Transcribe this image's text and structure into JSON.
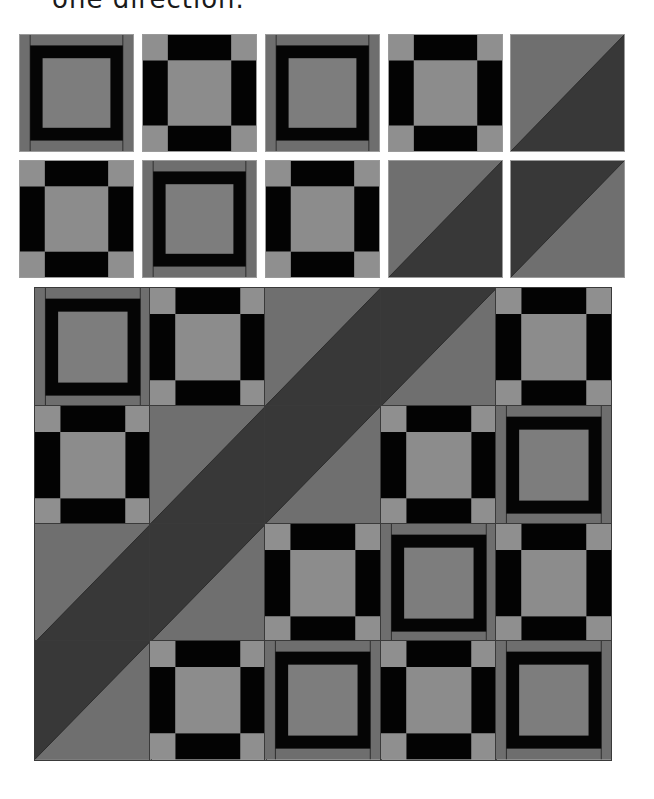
{
  "caption": {
    "text": "one direction."
  },
  "colors": {
    "background": "#ffffff",
    "frame_outer": "#6e6e6e",
    "frame_black": "#050505",
    "frame_center": "#7d7d7d",
    "nine_corner": "#8f8f8f",
    "nine_black": "#030303",
    "nine_center": "#8c8c8c",
    "hst_light": "#6f6f6f",
    "hst_dark": "#383838",
    "seam": "#2a2a2a"
  },
  "block_types": {
    "frame": "Square-in-square frame block (medium gray border, black band, gray center)",
    "nine": "Nine-patch block (light gray corners, black side bars, light gray center)",
    "hst_a": "Half-square triangle: light upper-left, dark lower-right",
    "hst_b": "Half-square triangle: dark upper-left, light lower-right"
  },
  "sample_blocks": {
    "rows": [
      [
        "frame",
        "nine",
        "frame",
        "nine",
        "hst_a"
      ],
      [
        "nine",
        "frame",
        "nine",
        "hst_a",
        "hst_b"
      ]
    ]
  },
  "quilt_layout": {
    "rows": [
      [
        "frame",
        "nine",
        "hst_a",
        "hst_b",
        "nine"
      ],
      [
        "nine",
        "hst_a",
        "hst_b",
        "nine",
        "frame"
      ],
      [
        "hst_a",
        "hst_b",
        "nine",
        "frame",
        "nine"
      ],
      [
        "hst_b",
        "nine",
        "frame",
        "nine",
        "frame"
      ]
    ]
  }
}
